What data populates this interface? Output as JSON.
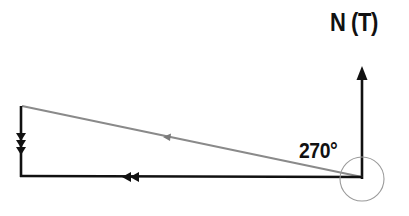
{
  "diagram": {
    "north_label": "N (T)",
    "angle_label": "270°",
    "colors": {
      "line": "#111111",
      "resultant_line": "#8a8a8a",
      "angle_circle": "#9a9a9a",
      "background": "#ffffff"
    },
    "vectors": [
      {
        "name": "north-reference",
        "from": [
          362,
          179
        ],
        "to": [
          362,
          68
        ],
        "arrowheads": 1,
        "direction": "north"
      },
      {
        "name": "west-vector",
        "from": [
          362,
          176
        ],
        "to": [
          21,
          176
        ],
        "arrowheads": 2,
        "direction": "west"
      },
      {
        "name": "south-vector",
        "from": [
          21,
          106
        ],
        "to": [
          21,
          176
        ],
        "arrowheads": 3,
        "direction": "south"
      },
      {
        "name": "resultant-vector",
        "from": [
          362,
          176
        ],
        "to": [
          21,
          106
        ],
        "arrowheads": 1,
        "direction": "west-north-west"
      }
    ],
    "angle_arc": {
      "center": [
        362,
        179
      ],
      "radius": 22,
      "value_deg": 270
    }
  }
}
